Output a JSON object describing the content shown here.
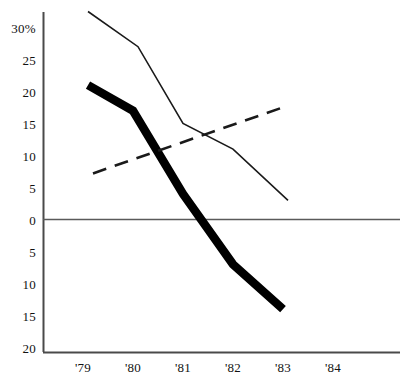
{
  "chart_data": {
    "type": "line",
    "title": "",
    "subtitle": "",
    "xlabel": "",
    "ylabel": "",
    "grid": false,
    "legend": "none",
    "x": [
      "'79",
      "'80",
      "'81",
      "'82",
      "'83",
      "'84"
    ],
    "xlim": [
      1978.7,
      1984.3
    ],
    "ylim": [
      -20,
      32.5
    ],
    "y_axis": {
      "tick_labels": [
        "30%",
        "25",
        "20",
        "15",
        "10",
        "5",
        "0",
        "5",
        "10",
        "15",
        "20"
      ],
      "tick_values": [
        30,
        25,
        20,
        15,
        10,
        5,
        0,
        -5,
        -10,
        -15,
        -20
      ],
      "unit": "%",
      "note": "labels below zero are printed without a minus sign"
    },
    "x_axis": {
      "tick_labels": [
        "'79",
        "'80",
        "'81",
        "'82",
        "'83",
        "'84"
      ],
      "tick_values": [
        1979,
        1980,
        1981,
        1982,
        1983,
        1984
      ]
    },
    "series": [
      {
        "name": "thin-solid-line",
        "style": "solid-thin",
        "color": "#1a1a1a",
        "points": [
          {
            "x": 1979.1,
            "y": 32.5
          },
          {
            "x": 1980.1,
            "y": 27.0
          },
          {
            "x": 1981.0,
            "y": 15.0
          },
          {
            "x": 1982.0,
            "y": 11.0
          },
          {
            "x": 1983.1,
            "y": 3.0
          }
        ]
      },
      {
        "name": "thick-solid-line",
        "style": "solid-thick",
        "color": "#000000",
        "points": [
          {
            "x": 1979.1,
            "y": 21.0
          },
          {
            "x": 1980.0,
            "y": 17.0
          },
          {
            "x": 1981.0,
            "y": 4.0
          },
          {
            "x": 1982.0,
            "y": -7.0
          },
          {
            "x": 1983.0,
            "y": -14.0
          }
        ]
      },
      {
        "name": "dashed-trend-line",
        "style": "dashed",
        "color": "#1a1a1a",
        "points": [
          {
            "x": 1979.2,
            "y": 7.2
          },
          {
            "x": 1983.1,
            "y": 17.8
          }
        ]
      }
    ],
    "zero_line": {
      "value": 0,
      "drawn": true
    },
    "annotations": []
  },
  "axis_labels": {
    "y": [
      {
        "text": "30%",
        "value": 30
      },
      {
        "text": "25",
        "value": 25
      },
      {
        "text": "20",
        "value": 20
      },
      {
        "text": "15",
        "value": 15
      },
      {
        "text": "10",
        "value": 10
      },
      {
        "text": "5",
        "value": 5
      },
      {
        "text": "0",
        "value": 0
      },
      {
        "text": "5",
        "value": -5
      },
      {
        "text": "10",
        "value": -10
      },
      {
        "text": "15",
        "value": -15
      },
      {
        "text": "20",
        "value": -20
      }
    ],
    "x": [
      {
        "text": "'79",
        "value": 1979
      },
      {
        "text": "'80",
        "value": 1980
      },
      {
        "text": "'81",
        "value": 1981
      },
      {
        "text": "'82",
        "value": 1982
      },
      {
        "text": "'83",
        "value": 1983
      },
      {
        "text": "'84",
        "value": 1984
      }
    ]
  },
  "colors": {
    "axis": "#4a4a4a",
    "thick_line": "#000000",
    "thin_line": "#1a1a1a",
    "dashed_line": "#1a1a1a",
    "background": "#ffffff",
    "text": "#111111"
  }
}
